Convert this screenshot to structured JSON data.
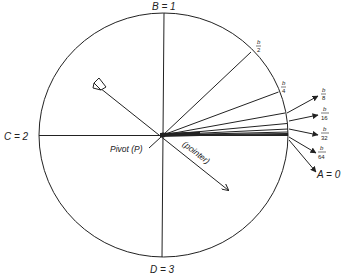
{
  "diagram": {
    "labels": {
      "top": "B = 1",
      "left": "C = 2",
      "bottom": "D = 3",
      "right_zero": "A = 0",
      "pivot": "Pivot (P)",
      "pointer": "(pointer)"
    },
    "fractions": [
      {
        "num": "b",
        "den": "2"
      },
      {
        "num": "b",
        "den": "4"
      },
      {
        "num": "b",
        "den": "8"
      },
      {
        "num": "b",
        "den": "16"
      },
      {
        "num": "b",
        "den": "32"
      },
      {
        "num": "b",
        "den": "64"
      }
    ],
    "colors": {
      "stroke": "#222222",
      "background": "#ffffff"
    }
  }
}
